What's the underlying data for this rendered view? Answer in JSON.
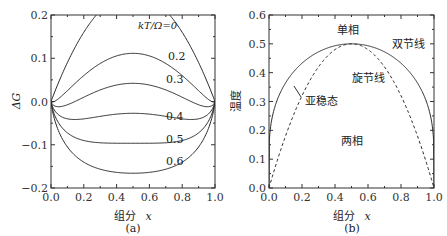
{
  "chart_data": [
    {
      "id": "a",
      "type": "line",
      "panel_label": "(a)",
      "title": "",
      "xlabel": "组分 x",
      "ylabel": "ΔG",
      "xlim": [
        0.0,
        1.0
      ],
      "ylim": [
        -0.2,
        0.2
      ],
      "xticks": [
        "0.0",
        "0.2",
        "0.4",
        "0.6",
        "0.8",
        "1.0"
      ],
      "yticks": [
        "0.2",
        "0.1",
        "0.0",
        "−0.1",
        "−0.2"
      ],
      "grid": false,
      "legend_title": "kT/Ω=0",
      "formula": "ΔG = x(1−x) + (kT/Ω)[x ln x + (1−x) ln(1−x)]",
      "series": [
        {
          "name": "kT/Ω=0",
          "param": 0.0,
          "label": "kT/Ω=0",
          "x": [
            0,
            0.1,
            0.2,
            0.3,
            0.4,
            0.5,
            0.6,
            0.7,
            0.8,
            0.9,
            1
          ],
          "values": [
            0,
            0.09,
            0.16,
            0.21,
            0.24,
            0.25,
            0.24,
            0.21,
            0.16,
            0.09,
            0
          ]
        },
        {
          "name": "0.2",
          "param": 0.2,
          "label": "0.2",
          "x": [
            0,
            0.1,
            0.2,
            0.3,
            0.4,
            0.5,
            0.6,
            0.7,
            0.8,
            0.9,
            1
          ],
          "values": [
            0,
            0.025,
            0.06,
            0.088,
            0.105,
            0.111,
            0.105,
            0.088,
            0.06,
            0.025,
            0
          ]
        },
        {
          "name": "0.3",
          "param": 0.3,
          "label": "0.3",
          "x": [
            0,
            0.1,
            0.2,
            0.3,
            0.4,
            0.5,
            0.6,
            0.7,
            0.8,
            0.9,
            1
          ],
          "values": [
            0,
            -0.008,
            0.01,
            0.027,
            0.038,
            0.042,
            0.038,
            0.027,
            0.01,
            -0.008,
            0
          ]
        },
        {
          "name": "0.4",
          "param": 0.4,
          "label": "0.4",
          "x": [
            0,
            0.1,
            0.2,
            0.3,
            0.4,
            0.5,
            0.6,
            0.7,
            0.8,
            0.9,
            1
          ],
          "values": [
            0,
            -0.04,
            -0.04,
            -0.034,
            -0.029,
            -0.027,
            -0.029,
            -0.034,
            -0.04,
            -0.04,
            0
          ]
        },
        {
          "name": "0.5",
          "param": 0.5,
          "label": "0.5",
          "x": [
            0,
            0.1,
            0.2,
            0.3,
            0.4,
            0.5,
            0.6,
            0.7,
            0.8,
            0.9,
            1
          ],
          "values": [
            0,
            -0.073,
            -0.09,
            -0.095,
            -0.096,
            -0.097,
            -0.096,
            -0.095,
            -0.09,
            -0.073,
            0
          ]
        },
        {
          "name": "0.6",
          "param": 0.6,
          "label": "0.6",
          "x": [
            0,
            0.1,
            0.2,
            0.3,
            0.4,
            0.5,
            0.6,
            0.7,
            0.8,
            0.9,
            1
          ],
          "values": [
            0,
            -0.105,
            -0.14,
            -0.156,
            -0.164,
            -0.166,
            -0.164,
            -0.156,
            -0.14,
            -0.105,
            0
          ]
        }
      ]
    },
    {
      "id": "b",
      "type": "line",
      "panel_label": "(b)",
      "title": "",
      "xlabel": "组分 x",
      "ylabel": "温度",
      "xlim": [
        0.0,
        1.0
      ],
      "ylim": [
        0.0,
        0.6
      ],
      "xticks": [
        "0.0",
        "0.2",
        "0.4",
        "0.6",
        "0.8",
        "1.0"
      ],
      "yticks": [
        "0.6",
        "0.5",
        "0.4",
        "0.3",
        "0.2",
        "0.1",
        "0.0"
      ],
      "grid": false,
      "annotations": [
        {
          "text": "单相",
          "x": 0.5,
          "y": 0.55
        },
        {
          "text": "双节线",
          "x": 0.82,
          "y": 0.48
        },
        {
          "text": "旋节线",
          "x": 0.6,
          "y": 0.38
        },
        {
          "text": "亚稳态",
          "x": 0.28,
          "y": 0.27
        },
        {
          "text": "两相",
          "x": 0.5,
          "y": 0.13
        }
      ],
      "series": [
        {
          "name": "双节线",
          "style": "solid",
          "x": [
            0.0,
            0.02,
            0.05,
            0.1,
            0.2,
            0.3,
            0.4,
            0.5,
            0.6,
            0.7,
            0.8,
            0.9,
            0.95,
            0.98,
            1.0
          ],
          "values": [
            0.0,
            0.196,
            0.25,
            0.303,
            0.361,
            0.402,
            0.48,
            0.5,
            0.48,
            0.402,
            0.361,
            0.303,
            0.25,
            0.196,
            0.0
          ]
        },
        {
          "name": "旋节线",
          "style": "dashed",
          "x": [
            0.0,
            0.1,
            0.2,
            0.3,
            0.4,
            0.5,
            0.6,
            0.7,
            0.8,
            0.9,
            1.0
          ],
          "values": [
            0.0,
            0.18,
            0.32,
            0.42,
            0.48,
            0.5,
            0.48,
            0.42,
            0.32,
            0.18,
            0.0
          ]
        }
      ]
    }
  ],
  "labels": {
    "a_panel": "(a)",
    "b_panel": "(b)",
    "a_xlabel": "组分",
    "a_xvar": "x",
    "b_xlabel": "组分",
    "b_xvar": "x",
    "a_ylabel": "ΔG",
    "b_ylabel": "温度",
    "legend_title": "kT/Ω=0",
    "curve_02": "0.2",
    "curve_03": "0.3",
    "curve_04": "0.4",
    "curve_05": "0.5",
    "curve_06": "0.6",
    "single_phase": "单相",
    "binodal": "双节线",
    "spinodal": "旋节线",
    "metastable": "亚稳态",
    "two_phase": "两相"
  },
  "colors": {
    "line": "#2a2a2a",
    "axis": "#333333"
  }
}
